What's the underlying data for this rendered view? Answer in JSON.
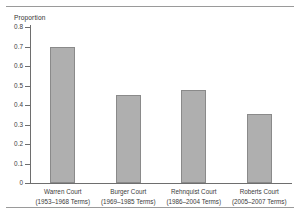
{
  "chart_data": {
    "type": "bar",
    "title": "",
    "subtitle": "",
    "xlabel": "",
    "ylabel": "Proportion",
    "ylim": [
      0,
      0.8
    ],
    "ytick_labels": [
      "0.8",
      "0.7",
      "0.6",
      "0.5",
      "0.4",
      "0.3",
      "0.2",
      "0.1",
      "0"
    ],
    "ytick_values": [
      0.8,
      0.7,
      0.6,
      0.5,
      0.4,
      0.3,
      0.2,
      0.1,
      0
    ],
    "grid": false,
    "legend": "none",
    "categories": [
      "Warren Court",
      "Burger Court",
      "Rehnquist Court",
      "Roberts Court"
    ],
    "category_sublabels": [
      "(1953–1968 Terms)",
      "(1969–1985 Terms)",
      "(1986–2004 Terms)",
      "(2005–2007 Terms)"
    ],
    "values": [
      0.697,
      0.452,
      0.477,
      0.355
    ],
    "bar_fill_color": "#afafaf",
    "bar_border_color": "#8a8a8a",
    "axis_color": "#6e6e6e",
    "text_color": "#3b3b3b",
    "background_color": "#ffffff"
  }
}
